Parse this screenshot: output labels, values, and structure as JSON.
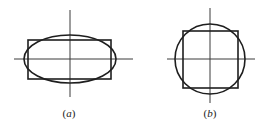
{
  "figure": {
    "panels": [
      {
        "id": "a",
        "label_open": "(",
        "label_letter": "a",
        "label_close": ")",
        "description": "Ellipse compared with its rectangle approximation, centered on crossed axes",
        "shapes": [
          "horizontal-axis",
          "vertical-axis",
          "rectangle",
          "ellipse"
        ]
      },
      {
        "id": "b",
        "label_open": "(",
        "label_letter": "b",
        "label_close": ")",
        "description": "Circle compared with its square approximation, centered on crossed axes",
        "shapes": [
          "horizontal-axis",
          "vertical-axis",
          "square",
          "circle"
        ]
      }
    ],
    "colors": {
      "stroke": "#1e1e1e",
      "axis": "#3a3a3a",
      "background": "#ffffff"
    }
  }
}
